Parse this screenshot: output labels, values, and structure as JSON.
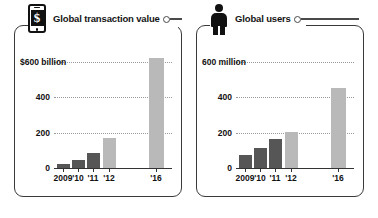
{
  "panels": [
    {
      "id": "transaction-value",
      "title": "Global transaction value",
      "icon": "mobile-phone-dollar-icon",
      "icon_glyph": "$",
      "y_axis_top_label": "$600 billion",
      "y_ticks": [
        "$600 billion",
        "400",
        "200",
        "0"
      ],
      "x_labels": [
        "2009",
        "'10",
        "'11",
        "'12",
        "'16"
      ]
    },
    {
      "id": "global-users",
      "title": "Global users",
      "icon": "person-icon",
      "icon_glyph": "",
      "y_axis_top_label": "600 million",
      "y_ticks": [
        "600 million",
        "400",
        "200",
        "0"
      ],
      "x_labels": [
        "2009",
        "'10",
        "'11",
        "'12",
        "'16"
      ]
    }
  ],
  "colors": {
    "actual_bar": "#565656",
    "projected_bar": "#b9b9b9",
    "frame": "#3a3a3a",
    "axis": "#333333",
    "grid": "#9a9a9a",
    "text": "#111111"
  },
  "chart_data": [
    {
      "type": "bar",
      "title": "Global transaction value",
      "xlabel": "",
      "ylabel": "$600 billion",
      "unit": "billion USD",
      "categories": [
        "2009",
        "'10",
        "'11",
        "'12",
        "'16"
      ],
      "values": [
        20,
        45,
        85,
        170,
        620
      ],
      "bar_styles": [
        "actual",
        "actual",
        "actual",
        "projected",
        "projected"
      ],
      "ylim": [
        0,
        620
      ],
      "ytick_values": [
        0,
        200,
        400,
        600
      ],
      "ytick_labels": [
        "0",
        "200",
        "400",
        "$600 billion"
      ],
      "grid": true,
      "legend": "none"
    },
    {
      "type": "bar",
      "title": "Global users",
      "xlabel": "",
      "ylabel": "600 million",
      "unit": "million users",
      "categories": [
        "2009",
        "'10",
        "'11",
        "'12",
        "'16"
      ],
      "values": [
        75,
        115,
        165,
        205,
        450
      ],
      "bar_styles": [
        "actual",
        "actual",
        "actual",
        "projected",
        "projected"
      ],
      "ylim": [
        0,
        620
      ],
      "ytick_values": [
        0,
        200,
        400,
        600
      ],
      "ytick_labels": [
        "0",
        "200",
        "400",
        "600 million"
      ],
      "grid": true,
      "legend": "none"
    }
  ]
}
